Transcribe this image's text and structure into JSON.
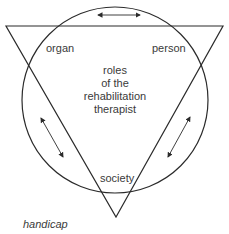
{
  "diagram": {
    "labels": {
      "organ": "organ",
      "person": "person",
      "society": "society",
      "center": [
        "roles",
        "of the",
        "rehabilitation",
        "therapist"
      ],
      "caption": "handicap"
    },
    "shapes": {
      "circle": {
        "cx": 115,
        "cy": 100,
        "r": 93
      },
      "triangle": {
        "points": [
          [
            6,
            26
          ],
          [
            223,
            26
          ],
          [
            116,
            217
          ]
        ]
      },
      "arrows": [
        {
          "from": [
            98,
            15
          ],
          "to": [
            140,
            15
          ],
          "bidirectional": true
        },
        {
          "from": [
            41,
            118
          ],
          "to": [
            63,
            157
          ],
          "bidirectional": true
        },
        {
          "from": [
            190,
            117
          ],
          "to": [
            168,
            157
          ],
          "bidirectional": true
        }
      ]
    },
    "colors": {
      "stroke": "#2b2b2b",
      "text": "#3a3a3a"
    }
  }
}
